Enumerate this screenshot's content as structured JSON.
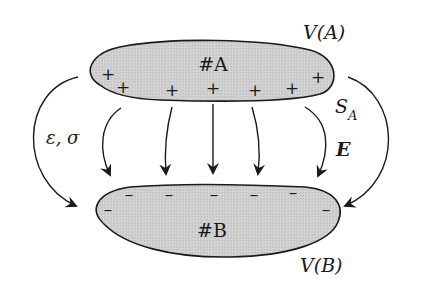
{
  "diagram": {
    "conductor_a": {
      "label": "#A",
      "volume_label": "V(A)",
      "surface_label_main": "S",
      "surface_label_sub": "A",
      "charge_sign": "+",
      "charges": [
        {
          "x": 108,
          "y": 80
        },
        {
          "x": 123,
          "y": 93
        },
        {
          "x": 172,
          "y": 96
        },
        {
          "x": 213,
          "y": 94
        },
        {
          "x": 255,
          "y": 96
        },
        {
          "x": 292,
          "y": 94
        },
        {
          "x": 318,
          "y": 83
        }
      ]
    },
    "conductor_b": {
      "label": "#B",
      "volume_label": "V(B)",
      "charge_sign": "–",
      "charges": [
        {
          "x": 129,
          "y": 200
        },
        {
          "x": 169,
          "y": 200
        },
        {
          "x": 214,
          "y": 200
        },
        {
          "x": 254,
          "y": 200
        },
        {
          "x": 293,
          "y": 198
        },
        {
          "x": 108,
          "y": 215
        },
        {
          "x": 326,
          "y": 215
        }
      ]
    },
    "medium_label": "ε, σ",
    "field_label": "E",
    "colors": {
      "fill": "#cfcfcf",
      "stroke": "#1a1a1a",
      "background": "#ffffff"
    }
  }
}
